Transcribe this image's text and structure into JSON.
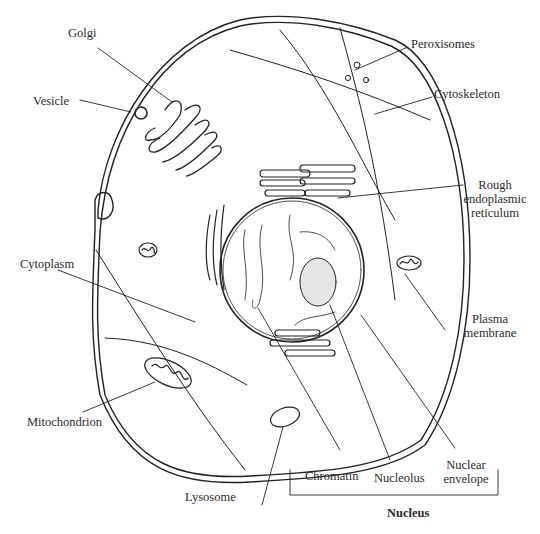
{
  "diagram": {
    "type": "animal-cell-anatomy",
    "labels": {
      "golgi": "Golgi",
      "vesicle": "Vesicle",
      "peroxisomes": "Peroxisomes",
      "cytoskeleton": "Cytoskeleton",
      "rough_er_line1": "Rough",
      "rough_er_line2": "endoplasmic",
      "rough_er_line3": "reticulum",
      "cytoplasm": "Cytoplasm",
      "plasma_membrane_line1": "Plasma",
      "plasma_membrane_line2": "membrane",
      "mitochondrion": "Mitochondrion",
      "lysosome": "Lysosome",
      "chromatin": "Chromatin",
      "nucleolus": "Nucleolus",
      "nuclear_envelope_line1": "Nuclear",
      "nuclear_envelope_line2": "envelope",
      "nucleus_group": "Nucleus"
    },
    "colors": {
      "line": "#222222",
      "background": "#ffffff",
      "nucleolus_fill": "#e6e6e6"
    }
  }
}
